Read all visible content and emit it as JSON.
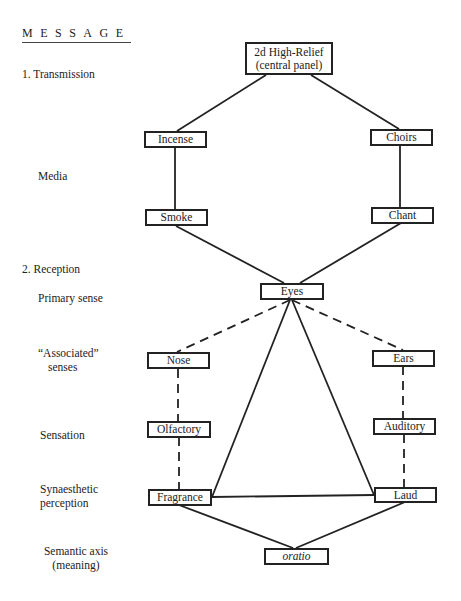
{
  "heading": "MESSAGE",
  "row_labels": {
    "transmission": "1.  Transmission",
    "media": "Media",
    "reception": "2.  Reception",
    "primary_sense": "Primary sense",
    "associated_line1": "“Associated”",
    "associated_line2": "senses",
    "sensation": "Sensation",
    "synaesthetic_line1": "Synaesthetic",
    "synaesthetic_line2": "perception",
    "semantic_line1": "Semantic axis",
    "semantic_line2": "(meaning)"
  },
  "nodes": {
    "relief_line1": "2d High-Relief",
    "relief_line2": "(central panel)",
    "incense": "Incense",
    "choirs": "Choirs",
    "smoke": "Smoke",
    "chant": "Chant",
    "eyes": "Eyes",
    "nose": "Nose",
    "ears": "Ears",
    "olfactory": "Olfactory",
    "auditory": "Auditory",
    "fragrance": "Fragrance",
    "laud": "Laud",
    "oratio": "oratio"
  },
  "edges": {
    "solid": [
      [
        "relief",
        "incense"
      ],
      [
        "relief",
        "choirs"
      ],
      [
        "incense",
        "smoke"
      ],
      [
        "choirs",
        "chant"
      ],
      [
        "smoke",
        "eyes"
      ],
      [
        "chant",
        "eyes"
      ],
      [
        "eyes",
        "fragrance"
      ],
      [
        "eyes",
        "laud"
      ],
      [
        "fragrance",
        "laud"
      ],
      [
        "fragrance",
        "oratio"
      ],
      [
        "laud",
        "oratio"
      ]
    ],
    "dashed": [
      [
        "eyes",
        "nose"
      ],
      [
        "eyes",
        "ears"
      ],
      [
        "nose",
        "olfactory"
      ],
      [
        "ears",
        "auditory"
      ],
      [
        "olfactory",
        "fragrance"
      ],
      [
        "auditory",
        "laud"
      ]
    ]
  },
  "colors": {
    "ink": "#222222",
    "background": "#ffffff"
  }
}
